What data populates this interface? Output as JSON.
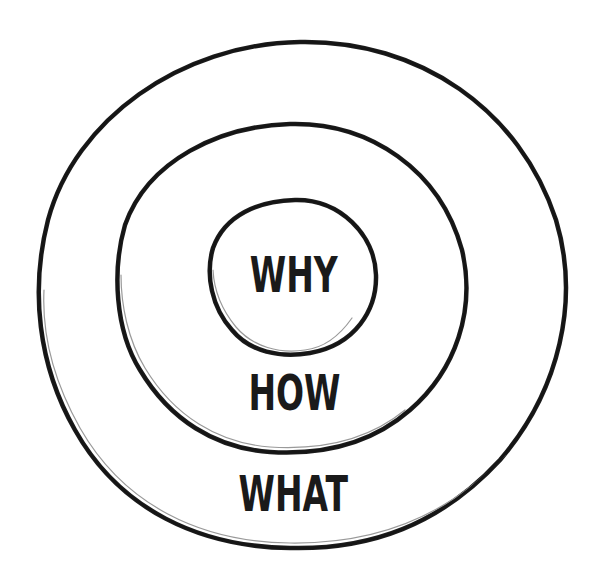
{
  "diagram": {
    "style": {
      "stroke_color": "#151515",
      "text_color": "#1a1a1a",
      "background": "#ffffff"
    },
    "rings": [
      {
        "id": "inner",
        "label": "WHY",
        "bounds": {
          "left": 210,
          "top": 200,
          "right": 376,
          "bottom": 355
        }
      },
      {
        "id": "middle",
        "label": "HOW",
        "bounds": {
          "left": 118,
          "top": 124,
          "right": 467,
          "bottom": 452
        }
      },
      {
        "id": "outer",
        "label": "WHAT",
        "bounds": {
          "left": 38,
          "top": 42,
          "right": 566,
          "bottom": 548
        }
      }
    ]
  }
}
